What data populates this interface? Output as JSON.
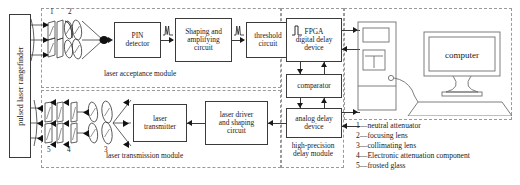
{
  "diagram": {
    "source_device": {
      "label": "pulsed laser rangefinder"
    },
    "modules": [
      {
        "id": "laser-acceptance-module",
        "label": "laser acceptance module"
      },
      {
        "id": "laser-transmission-module",
        "label": "laser transmission module"
      },
      {
        "id": "high-precision-delay-module",
        "label": "high-precision\ndelay module",
        "line1": "high-precision",
        "line2": "delay module"
      }
    ],
    "blocks": {
      "pin_detector": "PIN\ndetector",
      "pin_detector_l1": "PIN",
      "pin_detector_l2": "detector",
      "shaping_amplifying": "Shaping and amplifying circuit",
      "shaping_amplifying_l1": "Shaping and",
      "shaping_amplifying_l2": "amplifying",
      "shaping_amplifying_l3": "circuit",
      "threshold": "threshold circuit",
      "threshold_l1": "threshold",
      "threshold_l2": "circuit",
      "fpga": "FPGA digital delay device",
      "fpga_l1": "FPGA",
      "fpga_l2": "digital delay",
      "fpga_l3": "device",
      "comparator": "comparator",
      "analog_delay": "analog delay device",
      "analog_delay_l1": "analog delay",
      "analog_delay_l2": "device",
      "laser_driver": "laser driver and shaping circuit",
      "laser_driver_l1": "laser driver",
      "laser_driver_l2": "and shaping",
      "laser_driver_l3": "circuit",
      "laser_transmitter": "laser transmitter",
      "laser_transmitter_l1": "laser",
      "laser_transmitter_l2": "transmitter",
      "computer": "computer"
    },
    "optics_numbers": {
      "top": [
        "1",
        "2"
      ],
      "bottom": [
        "5",
        "4",
        "3"
      ]
    },
    "legend": [
      {
        "key": "1",
        "dash": "—",
        "text": "neutral attenuator"
      },
      {
        "key": "2",
        "dash": "—",
        "text": "focusing lens"
      },
      {
        "key": "3",
        "dash": "—",
        "text": "collimating lens"
      },
      {
        "key": "4",
        "dash": "—",
        "text": "Electronic attenuation component"
      },
      {
        "key": "5",
        "dash": "—",
        "text": "frosted glass"
      }
    ],
    "colors": {
      "line": "#3a3a3a",
      "dashed_boundary": "#9a9a9a",
      "text": "#1a1a1a",
      "background": "#ffffff"
    }
  }
}
